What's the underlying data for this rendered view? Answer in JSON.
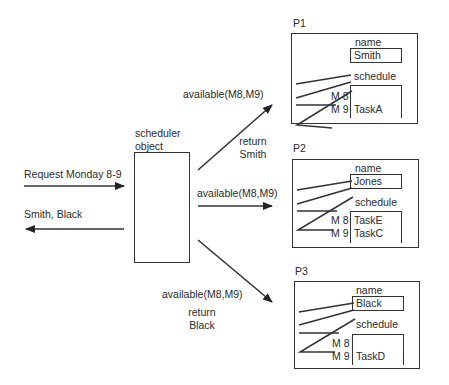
{
  "left": {
    "request_label": "Request Monday 8-9",
    "response_label": "Smith, Black"
  },
  "scheduler": {
    "label_line1": "scheduler",
    "label_line2": "object"
  },
  "messages": [
    {
      "call": "available(M8,M9)",
      "return_line1": "return",
      "return_line2": "Smith"
    },
    {
      "call": "available(M8,M9)"
    },
    {
      "call": "available(M8,M9)",
      "return_line1": "return",
      "return_line2": "Black"
    }
  ],
  "persons": [
    {
      "id": "P1",
      "name_label": "name",
      "name": "Smith",
      "schedule_label": "schedule",
      "slots": [
        {
          "time": "M 8",
          "task": ""
        },
        {
          "time": "M 9",
          "task": "TaskA"
        }
      ]
    },
    {
      "id": "P2",
      "name_label": "name",
      "name": "Jones",
      "schedule_label": "schedule",
      "slots": [
        {
          "time": "M 8",
          "task": "TaskE"
        },
        {
          "time": "M 9",
          "task": "TaskC"
        }
      ]
    },
    {
      "id": "P3",
      "name_label": "name",
      "name": "Black",
      "schedule_label": "schedule",
      "slots": [
        {
          "time": "M 8",
          "task": ""
        },
        {
          "time": "M 9",
          "task": "TaskD"
        }
      ]
    }
  ]
}
